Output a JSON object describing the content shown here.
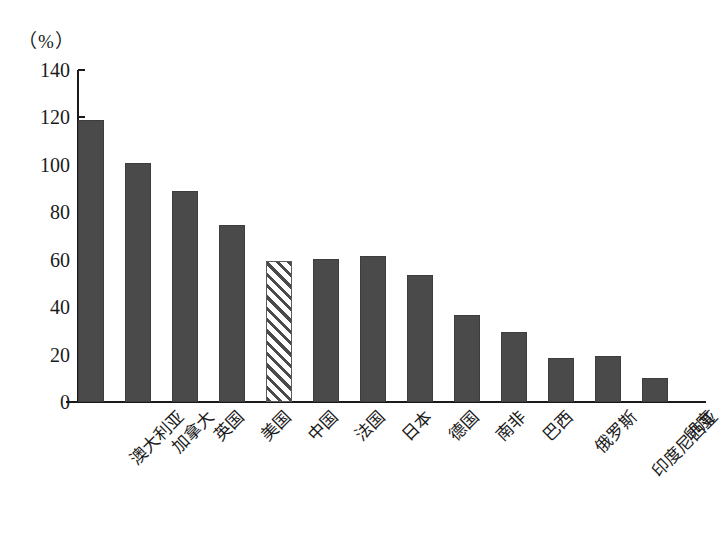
{
  "chart_data": {
    "type": "bar",
    "title": "",
    "subtitle": "",
    "xlabel": "",
    "ylabel": "（%）",
    "unit_label": "（%）",
    "categories": [
      "澳大利亚",
      "加拿大",
      "英国",
      "美国",
      "中国",
      "法国",
      "日本",
      "德国",
      "南非",
      "巴西",
      "俄罗斯",
      "印度尼西亚",
      "印度"
    ],
    "values": [
      119,
      101,
      89,
      74.5,
      59.5,
      60.5,
      61.5,
      53.5,
      36.5,
      29.5,
      18.5,
      19.5,
      10
    ],
    "highlight_index": 4,
    "highlight_style": "diagonal-hatch",
    "ylim": [
      0,
      140
    ],
    "ytick_labels": [
      "140",
      "120",
      "100",
      "80",
      "60",
      "40",
      "20",
      "0"
    ],
    "ytick_values": [
      140,
      120,
      100,
      80,
      60,
      40,
      20,
      0
    ],
    "grid": false,
    "legend": "none",
    "bar_color": "#4a4a4a",
    "highlight_color": "#ffffff",
    "axis_color": "#1a1a1a",
    "background": "#ffffff"
  }
}
